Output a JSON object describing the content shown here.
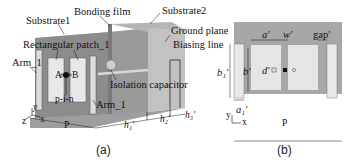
{
  "figure_a": {
    "caption": "(a)",
    "labels": {
      "substrate1": "Substrate1",
      "bonding_film": "Bonding film",
      "substrate2": "Substrate2",
      "rectangular_patch": "Rectangular patch_1",
      "ground_plane": "Ground plane",
      "biasing_line": "Biasing line",
      "arm_left": "Arm_1",
      "arm_right": "Arm_1",
      "isolation_capacitor": "Isolation capacitor",
      "port_a": "A",
      "port_b": "B",
      "pin": "p-i-n",
      "dim_p": "P",
      "dim_h1": "h₁′",
      "dim_h2": "h₂′",
      "dim_h3": "h₃′",
      "axis_x": "x",
      "axis_y": "y",
      "axis_z": "z"
    }
  },
  "figure_b": {
    "caption": "(b)",
    "labels": {
      "dim_a": "a′",
      "dim_w": "w′",
      "dim_gap": "gap′",
      "dim_b1": "b₁′",
      "dim_b": "b′",
      "dim_d": "d′",
      "dim_a1": "a₁′",
      "dim_p": "P",
      "axis_x": "x",
      "axis_y": "y"
    }
  },
  "colors": {
    "substrate_dark": "#8f8f8f",
    "substrate_mid": "#a9a9a9",
    "substrate_light": "#c4c4c4",
    "patch": "#e6e6e6",
    "line": "#111111"
  }
}
